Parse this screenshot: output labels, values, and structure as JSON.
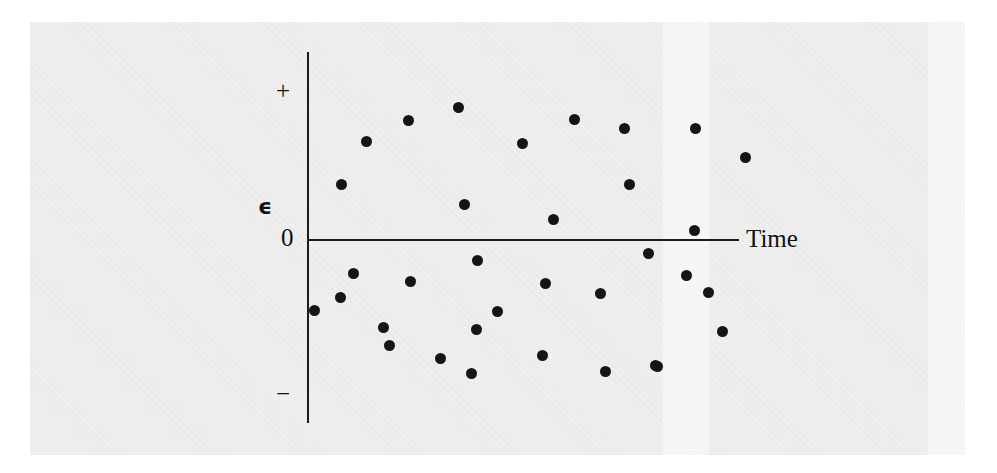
{
  "figure": {
    "kind": "residual-scatter-plot",
    "background_color": "#f0f0f0",
    "ink_color": "#151515"
  },
  "axes": {
    "y_axis": {
      "name": "vertical-axis",
      "top_label": "+",
      "bottom_label": "−",
      "variable_symbol": "ϵ",
      "zero_label": "0"
    },
    "x_axis": {
      "name": "horizontal-axis",
      "label": "Time"
    }
  },
  "chart_data": {
    "type": "scatter",
    "title": "",
    "xlabel": "Time",
    "ylabel": "ϵ",
    "grid": false,
    "legend": null,
    "xlim": [
      0,
      1
    ],
    "ylim": [
      -1,
      1
    ],
    "ytick_labels": [
      "+",
      "0",
      "−"
    ],
    "annotations": [
      "+",
      "ϵ",
      "0",
      "−",
      "Time"
    ],
    "n_points": 34,
    "note": "Points are plotted in pixel coordinates of the source figure; y measured downward from the top of the image, the zero line sits at y=240.",
    "zero_line_y_px": 240,
    "points_px": [
      [
        341,
        184
      ],
      [
        366,
        141
      ],
      [
        408,
        120
      ],
      [
        458,
        107
      ],
      [
        464,
        204
      ],
      [
        522,
        143
      ],
      [
        553,
        219
      ],
      [
        574,
        119
      ],
      [
        624,
        128
      ],
      [
        629,
        184
      ],
      [
        695,
        128
      ],
      [
        745,
        157
      ],
      [
        694,
        230
      ],
      [
        353,
        273
      ],
      [
        340,
        297
      ],
      [
        410,
        281
      ],
      [
        389,
        345
      ],
      [
        471,
        373
      ],
      [
        477,
        260
      ],
      [
        476,
        329
      ],
      [
        545,
        283
      ],
      [
        542,
        355
      ],
      [
        600,
        293
      ],
      [
        605,
        371
      ],
      [
        655,
        365
      ],
      [
        648,
        253
      ],
      [
        686,
        275
      ],
      [
        722,
        331
      ],
      [
        657,
        366
      ],
      [
        440,
        358
      ],
      [
        497,
        311
      ],
      [
        314,
        310
      ],
      [
        383,
        327
      ],
      [
        708,
        292
      ]
    ]
  }
}
